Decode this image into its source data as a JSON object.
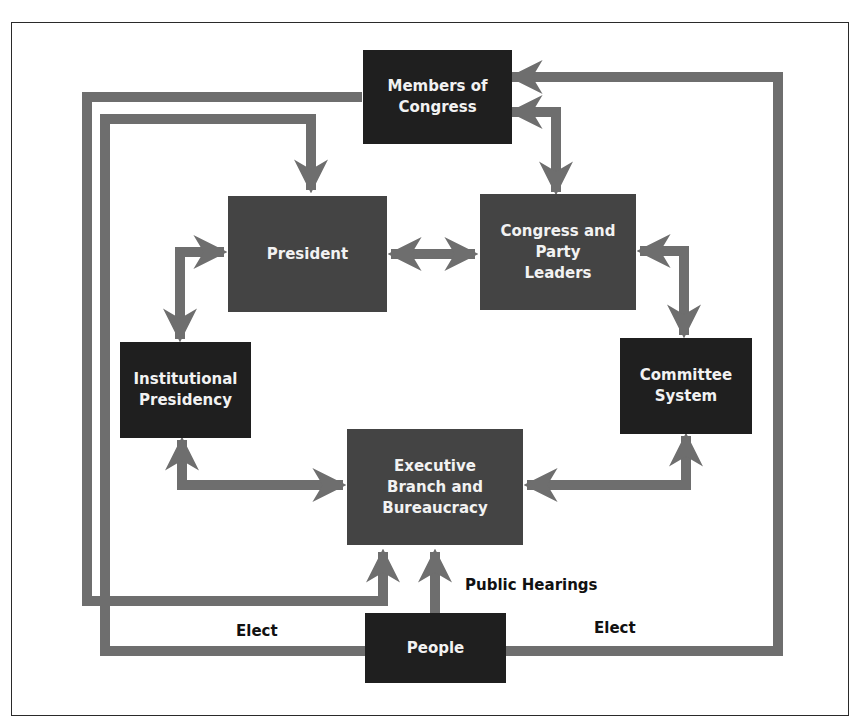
{
  "diagram": {
    "title_fragment": "",
    "colors": {
      "connector": "#6e6e6e",
      "box_dark": "#1f1f1f",
      "box_mid": "#444444",
      "box_text": "#f2f2f2",
      "label_text": "#111111",
      "frame": "#2a2a2a"
    },
    "nodes": {
      "members_of_congress": "Members of\nCongress",
      "president": "President",
      "congress_party_leaders": "Congress and\nParty\nLeaders",
      "institutional_presidency": "Institutional\nPresidency",
      "committee_system": "Committee\nSystem",
      "executive_branch": "Executive\nBranch and\nBureaucracy",
      "people": "People"
    },
    "edge_labels": {
      "elect_left": "Elect",
      "elect_right": "Elect",
      "public_hearings": "Public Hearings"
    },
    "edges": [
      {
        "from": "Members of Congress",
        "to": "Executive Branch and Bureaucracy",
        "direction": "one-way"
      },
      {
        "from": "People",
        "to": "President",
        "label": "Elect",
        "direction": "one-way"
      },
      {
        "from": "People",
        "to": "Members of Congress",
        "label": "Elect",
        "direction": "one-way"
      },
      {
        "from": "People",
        "to": "Executive Branch and Bureaucracy",
        "label": "Public Hearings",
        "direction": "one-way"
      },
      {
        "from": "Members of Congress",
        "to": "Congress and Party Leaders",
        "direction": "two-way"
      },
      {
        "from": "President",
        "to": "Congress and Party Leaders",
        "direction": "two-way"
      },
      {
        "from": "President",
        "to": "Institutional Presidency",
        "direction": "two-way"
      },
      {
        "from": "Congress and Party Leaders",
        "to": "Committee System",
        "direction": "two-way"
      },
      {
        "from": "Institutional Presidency",
        "to": "Executive Branch and Bureaucracy",
        "direction": "two-way"
      },
      {
        "from": "Committee System",
        "to": "Executive Branch and Bureaucracy",
        "direction": "two-way"
      }
    ]
  }
}
